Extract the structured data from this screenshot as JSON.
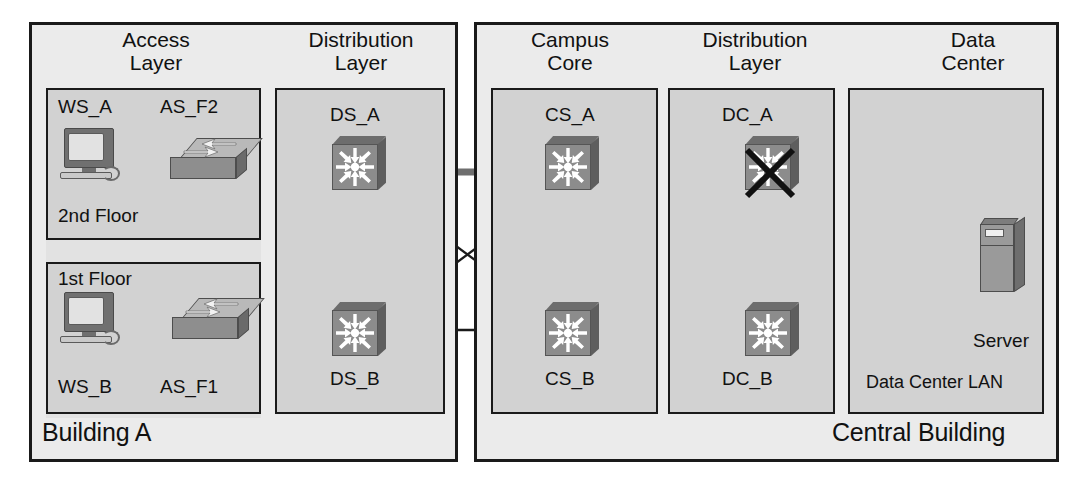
{
  "diagram": {
    "buildings": [
      {
        "id": "building-a",
        "label": "Building A"
      },
      {
        "id": "central-building",
        "label": "Central Building"
      }
    ],
    "layers": [
      {
        "id": "access-layer",
        "title": "Access\nLayer"
      },
      {
        "id": "distribution-left",
        "title": "Distribution\nLayer"
      },
      {
        "id": "campus-core",
        "title": "Campus\nCore"
      },
      {
        "id": "distribution-right",
        "title": "Distribution\nLayer"
      },
      {
        "id": "data-center",
        "title": "Data\nCenter"
      }
    ],
    "floors": [
      {
        "id": "floor-2",
        "label": "2nd Floor"
      },
      {
        "id": "floor-1",
        "label": "1st Floor"
      }
    ],
    "nodes": [
      {
        "id": "ws-a",
        "label": "WS_A",
        "type": "workstation"
      },
      {
        "id": "as-f2",
        "label": "AS_F2",
        "type": "access-switch"
      },
      {
        "id": "ws-b",
        "label": "WS_B",
        "type": "workstation"
      },
      {
        "id": "as-f1",
        "label": "AS_F1",
        "type": "access-switch"
      },
      {
        "id": "ds-a",
        "label": "DS_A",
        "type": "switch"
      },
      {
        "id": "ds-b",
        "label": "DS_B",
        "type": "switch"
      },
      {
        "id": "cs-a",
        "label": "CS_A",
        "type": "switch"
      },
      {
        "id": "cs-b",
        "label": "CS_B",
        "type": "switch"
      },
      {
        "id": "dc-a",
        "label": "DC_A",
        "type": "switch",
        "failed": true
      },
      {
        "id": "dc-b",
        "label": "DC_B",
        "type": "switch"
      },
      {
        "id": "server",
        "label": "Server",
        "type": "server"
      }
    ],
    "segments": [
      {
        "id": "data-center-lan",
        "label": "Data Center LAN"
      }
    ],
    "colors": {
      "page_background": "#ffffff",
      "building_fill": "#ebebeb",
      "layer_fill": "#d2d2d2",
      "outline": "#1a1a1a",
      "device_face": "#8c8c8c",
      "active_path": "#6e6e6e",
      "link": "#1a1a1a",
      "failure_mark": "#111111"
    }
  }
}
